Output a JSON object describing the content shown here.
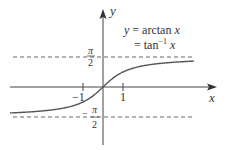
{
  "figure": {
    "title_line1": "y = arctan x",
    "title_line2": "= tan⁻¹ x",
    "title_parts": {
      "y": "y",
      "eq": " = arctan ",
      "x": "x",
      "eq2": "= tan",
      "sup": "−1",
      "x2": " x"
    },
    "axes": {
      "x_label": "x",
      "y_label": "y"
    },
    "ticks": {
      "neg_one": "−1",
      "pos_one": "1"
    },
    "asymptotes": {
      "upper_numerator": "π",
      "upper_denominator": "2",
      "lower_sign": "−",
      "lower_numerator": "π",
      "lower_denominator": "2"
    },
    "colors": {
      "curve": "#555555",
      "axis": "#444444",
      "dash": "#666666",
      "text": "#333333"
    }
  },
  "chart_data": {
    "type": "line",
    "xlabel": "x",
    "ylabel": "y",
    "xlim": [
      -4.65,
      4.5
    ],
    "ylim": [
      -3.0,
      4.0
    ],
    "grid": false,
    "x_ticks": [
      -1,
      1
    ],
    "y_ticks": [
      "π/2",
      "−π/2"
    ],
    "asymptotes": [
      1.5708,
      -1.5708
    ],
    "series": [
      {
        "name": "arctan x",
        "x": [
          -4.6,
          -4,
          -3,
          -2,
          -1.5,
          -1,
          -0.5,
          0,
          0.5,
          1,
          1.5,
          2,
          3,
          4,
          4.5
        ],
        "y": [
          -1.357,
          -1.326,
          -1.249,
          -1.107,
          -0.983,
          -0.785,
          -0.464,
          0,
          0.464,
          0.785,
          0.983,
          1.107,
          1.249,
          1.326,
          1.352
        ]
      }
    ]
  }
}
